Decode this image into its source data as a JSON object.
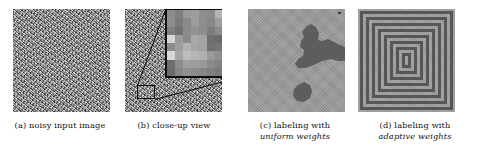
{
  "figure": {
    "type": "image-panel-figure",
    "panel_count": 4,
    "background_color": "#ffffff",
    "panels": [
      {
        "id": "a",
        "tag": "(a)",
        "caption_line1": "(a) noisy input image",
        "caption_line2": "",
        "emphasis": "",
        "content": "heavy-salt-and-pepper noise over a faint concentric-square pattern",
        "mean_gray": "#8d8d8d"
      },
      {
        "id": "b",
        "tag": "(b)",
        "caption_line1": "(b) close-up view",
        "caption_line2": "",
        "emphasis": "",
        "content": "same noisy image with a magnified pixel-block inset drawn from a small region near the lower-left",
        "mean_gray": "#8d8d8d"
      },
      {
        "id": "c",
        "tag": "(c)",
        "caption_line1": "(c) labeling with",
        "caption_line2": "uniform weights",
        "emphasis": "uniform",
        "content": "flat light-gray label map with a few irregular dark blobs; the square structure is lost",
        "background_gray": "#9c9c9c",
        "blob_gray": "#5d5d5d"
      },
      {
        "id": "d",
        "tag": "(d)",
        "caption_line1": "(d) labeling with",
        "caption_line2": "adaptive weights",
        "emphasis": "adaptive",
        "content": "clean concentric nested squares recovered; 8 nested ring pairs around a small center square",
        "background_gray": "#a0a0a0",
        "ring_gray": "#565656",
        "ring_count": 8
      }
    ]
  },
  "chart_data": {
    "type": "heatmap",
    "title": "",
    "panels": [
      "(a) noisy input image",
      "(b) close-up view",
      "(c) labeling with uniform weights",
      "(d) labeling with adaptive weights"
    ],
    "inset_pixels": [
      [
        "#8b8b8b",
        "#7e7e7e",
        "#9a9a9a",
        "#9e9e9e",
        "#8f8f8f",
        "#8a8a8a",
        "#b4b4b4"
      ],
      [
        "#8d8d8d",
        "#7a7a7a",
        "#8a8a8a",
        "#9c9c9c",
        "#8d8d8d",
        "#888888",
        "#9d9d9d"
      ],
      [
        "#7f7f7f",
        "#707070",
        "#8b8b8b",
        "#929292",
        "#8e8e8e",
        "#7d7d7d",
        "#8a8a8a"
      ],
      [
        "#d6d6d6",
        "#9b9b9b",
        "#8a8a8a",
        "#a9a9a9",
        "#a2a2a2",
        "#6e6e6e",
        "#6a6a6a"
      ],
      [
        "#8c8c8c",
        "#9f9f9f",
        "#b2b2b2",
        "#a6a6a6",
        "#a3a3a3",
        "#707070",
        "#757575"
      ],
      [
        "#d9d9d9",
        "#a5a5a5",
        "#bdbdbd",
        "#b5b5b5",
        "#b0b0b0",
        "#9a9a9a",
        "#8e8e8e"
      ],
      [
        "#6f6f6f",
        "#8d8d8d",
        "#a0a0a0",
        "#9d9d9d",
        "#9a9a9a",
        "#8a8a8a",
        "#828282"
      ],
      [
        "#6c6c6c",
        "#858585",
        "#8f8f8f",
        "#8b8b8b",
        "#868686",
        "#7f7f7f",
        "#7a7a7a"
      ]
    ],
    "grid": false,
    "legend": "none"
  }
}
